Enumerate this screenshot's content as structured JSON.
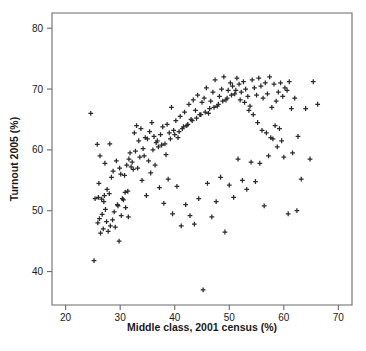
{
  "figure": {
    "width": 366,
    "height": 351,
    "background": "#ffffff",
    "marker_color": "#2b2b2b",
    "axis_color": "#6b6b6b",
    "text_color": "#1a1a1a"
  },
  "chart_data": {
    "type": "scatter",
    "title": "",
    "xlabel": "Middle class, 2001 census (%)",
    "ylabel": "Turnout 2005 (%)",
    "xlim": [
      17.5,
      72.5
    ],
    "ylim": [
      34.5,
      82.5
    ],
    "xticks": [
      20,
      30,
      40,
      50,
      60,
      70
    ],
    "yticks": [
      40,
      50,
      60,
      70,
      80
    ],
    "xtick_labels": [
      "20",
      "30",
      "40",
      "50",
      "60",
      "70"
    ],
    "ytick_labels": [
      "40",
      "50",
      "60",
      "70",
      "80"
    ],
    "grid": false,
    "legend": null,
    "marker": "plus",
    "n_points": 420,
    "series": [
      {
        "name": "Constituencies",
        "x": [
          24.6,
          25.8,
          26.3,
          26.0,
          26.6,
          27.1,
          26.2,
          25.4,
          27.5,
          26.9,
          27.8,
          28.2,
          26.4,
          25.9,
          27.0,
          28.6,
          29.1,
          27.3,
          26.7,
          28.0,
          29.5,
          28.9,
          27.6,
          26.1,
          25.2,
          29.8,
          30.2,
          28.4,
          27.2,
          30.6,
          31.0,
          29.3,
          28.7,
          30.9,
          31.5,
          29.9,
          28.1,
          31.8,
          32.2,
          30.4,
          29.6,
          32.6,
          33.0,
          31.2,
          30.1,
          33.4,
          33.8,
          31.6,
          30.8,
          34.2,
          34.6,
          32.0,
          31.4,
          35.0,
          35.4,
          32.8,
          32.4,
          35.8,
          36.2,
          33.6,
          33.2,
          36.6,
          37.0,
          34.4,
          34.0,
          37.4,
          37.8,
          35.2,
          34.8,
          38.2,
          38.6,
          36.0,
          35.6,
          39.0,
          39.4,
          36.8,
          36.4,
          39.8,
          40.2,
          37.6,
          37.2,
          40.6,
          41.0,
          38.4,
          38.0,
          41.4,
          41.8,
          39.2,
          38.8,
          42.2,
          42.6,
          40.0,
          39.6,
          43.0,
          43.4,
          40.8,
          40.4,
          43.8,
          44.2,
          41.6,
          41.2,
          44.6,
          45.0,
          42.4,
          42.0,
          45.4,
          45.8,
          43.2,
          42.8,
          46.2,
          46.6,
          44.0,
          43.6,
          47.0,
          47.4,
          44.8,
          44.4,
          47.8,
          48.2,
          45.6,
          45.2,
          48.6,
          49.0,
          46.4,
          46.0,
          49.4,
          49.8,
          47.2,
          46.8,
          50.2,
          50.6,
          48.0,
          47.6,
          51.0,
          51.4,
          48.8,
          48.4,
          51.8,
          52.2,
          49.6,
          49.2,
          52.6,
          53.0,
          50.4,
          50.0,
          53.4,
          53.8,
          51.2,
          50.8,
          54.2,
          54.6,
          52.0,
          51.6,
          55.0,
          55.4,
          52.8,
          52.4,
          55.8,
          56.2,
          53.6,
          53.2,
          56.6,
          57.0,
          54.4,
          54.0,
          57.4,
          57.8,
          55.2,
          54.8,
          58.2,
          58.6,
          56.0,
          55.6,
          59.0,
          59.4,
          56.8,
          56.4,
          59.8,
          60.2,
          57.6,
          57.2,
          60.6,
          61.0,
          58.4,
          58.0,
          61.4,
          62.0,
          59.2,
          58.8,
          62.6,
          63.2,
          60.0,
          59.6,
          64.0,
          64.8,
          60.8,
          65.4,
          66.2,
          61.6,
          62.4
        ],
        "y": [
          66.0,
          60.9,
          59.0,
          52.2,
          51.9,
          52.5,
          48.7,
          52.0,
          48.2,
          47.0,
          46.6,
          47.5,
          46.3,
          48.0,
          51.5,
          48.5,
          47.3,
          50.2,
          49.4,
          52.8,
          51.0,
          49.8,
          53.5,
          54.5,
          41.8,
          45.0,
          49.2,
          55.5,
          57.8,
          51.8,
          50.5,
          58.2,
          56.5,
          53.0,
          49.0,
          57.0,
          61.0,
          59.5,
          58.0,
          52.0,
          50.8,
          62.8,
          64.0,
          57.5,
          56.0,
          61.5,
          63.5,
          58.5,
          55.8,
          60.2,
          62.0,
          57.2,
          53.2,
          61.8,
          63.0,
          59.8,
          56.8,
          64.5,
          62.2,
          58.8,
          57.0,
          61.2,
          60.5,
          59.0,
          55.0,
          62.5,
          63.8,
          58.2,
          52.5,
          61.0,
          64.2,
          60.0,
          56.2,
          62.8,
          67.0,
          61.5,
          57.5,
          63.2,
          64.8,
          60.8,
          53.8,
          62.0,
          65.5,
          59.2,
          51.2,
          63.5,
          66.2,
          61.8,
          55.2,
          64.0,
          67.5,
          62.5,
          49.5,
          65.0,
          68.2,
          63.0,
          54.0,
          66.5,
          69.0,
          63.8,
          47.5,
          65.8,
          67.8,
          64.2,
          51.0,
          68.5,
          70.2,
          64.8,
          49.2,
          66.0,
          68.0,
          65.2,
          47.8,
          69.5,
          71.5,
          65.8,
          52.0,
          67.2,
          68.8,
          66.2,
          37.0,
          70.0,
          72.0,
          66.8,
          54.5,
          68.2,
          69.8,
          67.0,
          49.0,
          71.0,
          70.5,
          67.5,
          51.5,
          69.2,
          71.8,
          68.0,
          55.5,
          70.8,
          69.5,
          68.5,
          46.5,
          71.2,
          70.0,
          69.0,
          54.2,
          68.8,
          67.2,
          69.8,
          52.2,
          71.5,
          70.2,
          68.2,
          58.5,
          69.0,
          71.8,
          67.8,
          55.0,
          70.5,
          68.5,
          66.5,
          53.5,
          71.0,
          69.2,
          65.8,
          58.0,
          72.0,
          67.0,
          64.5,
          54.8,
          70.8,
          68.0,
          63.2,
          57.8,
          69.5,
          71.0,
          62.8,
          50.8,
          68.8,
          70.2,
          62.0,
          59.0,
          69.8,
          71.2,
          64.0,
          61.8,
          66.8,
          68.5,
          63.5,
          60.5,
          62.2,
          55.2,
          58.8,
          61.5,
          66.8,
          58.5,
          49.5,
          71.2,
          67.5,
          59.5,
          50.0
        ]
      }
    ]
  },
  "plot_geometry": {
    "left": 52,
    "right": 352,
    "top": 13,
    "bottom": 305,
    "tick_length": 5
  },
  "caption_ghost": ""
}
